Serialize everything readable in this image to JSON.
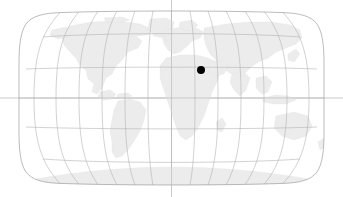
{
  "figure": {
    "type": "world-map",
    "projection": "Robinson",
    "title": "",
    "background_color": "#ffffff",
    "width": 343,
    "height": 197
  },
  "map": {
    "land_color": "#ececec",
    "land_stroke_color": "#e2e2e2",
    "ocean_color": "#ffffff",
    "outline_color": "#9e9e9e",
    "bounds": {
      "left": 19,
      "right": 324,
      "top": 11,
      "bottom": 185,
      "center_x": 171.5,
      "center_y": 98
    }
  },
  "graticule": {
    "color": "#b3b3b3",
    "stroke_width": 0.6,
    "meridian_interval_degrees": 30,
    "parallel_interval_degrees": 30,
    "meridian_labels": [
      "180W",
      "150W",
      "120W",
      "90W",
      "60W",
      "30W",
      "0",
      "30E",
      "60E",
      "90E",
      "120E",
      "150E",
      "180E"
    ],
    "parallel_labels": [
      "60N",
      "30N",
      "0",
      "30S",
      "60S"
    ],
    "equator_extends_full_width": true,
    "central_meridian_extends_full_height": true
  },
  "crosshair": {
    "color": "#b3b3b3",
    "equator_y": 98,
    "central_meridian_x": 171.5
  },
  "marker": {
    "label": "location-marker",
    "color": "#000000",
    "radius": 4,
    "x": 201,
    "y": 70,
    "approx_longitude_degrees": 32,
    "approx_latitude_degrees": 27,
    "region": "Northeast Africa / Egypt"
  },
  "legend": {
    "visible": false,
    "entries": []
  },
  "axes": {
    "visible": false
  },
  "chart_data": {
    "type": "scatter",
    "title": "",
    "xlabel": "",
    "ylabel": "",
    "projection": "Robinson world map",
    "xlim": [
      -180,
      180
    ],
    "ylim": [
      -90,
      90
    ],
    "grid": true,
    "legend_position": "none",
    "series": [
      {
        "name": "location-marker",
        "color": "#000000",
        "marker": "circle",
        "marker_size": 8,
        "x": [
          32
        ],
        "y": [
          27
        ]
      }
    ]
  }
}
